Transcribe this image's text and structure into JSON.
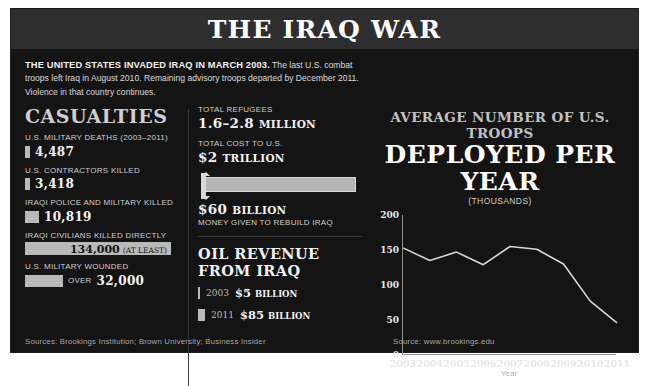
{
  "header": {
    "title": "THE IRAQ WAR"
  },
  "intro": {
    "lead": "THE UNITED STATES INVADED IRAQ IN MARCH 2003.",
    "body": " The last U.S. combat troops left Iraq in August 2010. Remaining advisory troops departed by December 2011. Violence in that country continues."
  },
  "casualties": {
    "heading": "CASUALTIES",
    "items": [
      {
        "label": "U.S. MILITARY DEATHS (2003–2011)",
        "value": "4,487",
        "suffix": "",
        "bar_width": 5,
        "value_in_bar": false
      },
      {
        "label": "U.S. CONTRACTORS KILLED",
        "value": "3,418",
        "suffix": "",
        "bar_width": 5,
        "value_in_bar": false
      },
      {
        "label": "IRAQI POLICE AND MILITARY KILLED",
        "value": "10,819",
        "suffix": "",
        "bar_width": 14,
        "value_in_bar": false
      },
      {
        "label": "IRAQI CIVILIANS KILLED DIRECTLY",
        "value": "134,000",
        "suffix": "(AT LEAST)",
        "bar_width": 146,
        "value_in_bar": true
      },
      {
        "label": "U.S. MILITARY WOUNDED",
        "value": "32,000",
        "suffix": "OVER",
        "bar_width": 38,
        "value_in_bar": false
      }
    ]
  },
  "middle": {
    "refugees": {
      "label": "TOTAL REFUGEES",
      "value": "1.6–2.8",
      "unit": "MILLION"
    },
    "cost": {
      "label": "TOTAL COST TO U.S.",
      "value": "$2",
      "unit": "TRILLION"
    },
    "rebuild": {
      "value": "$60",
      "unit": "BILLION",
      "note": "MONEY GIVEN TO REBUILD IRAQ"
    },
    "oil": {
      "heading": "OIL REVENUE FROM IRAQ",
      "rows": [
        {
          "year": "2003",
          "value": "$5",
          "unit": "BILLION",
          "bar_width": 2
        },
        {
          "year": "2011",
          "value": "$85",
          "unit": "BILLION",
          "bar_width": 7
        }
      ]
    }
  },
  "chart_data": {
    "type": "line",
    "title_line1": "AVERAGE NUMBER OF U.S. TROOPS",
    "title_line2": "DEPLOYED PER YEAR",
    "subtitle": "(THOUSANDS)",
    "xlabel": "Year",
    "ylabel": "",
    "categories": [
      "2003",
      "2004",
      "2005",
      "2006",
      "2007",
      "2008",
      "2009",
      "2010",
      "2011"
    ],
    "x": [
      2003,
      2004,
      2005,
      2006,
      2007,
      2008,
      2009,
      2010,
      2011
    ],
    "values": [
      153,
      135,
      147,
      129,
      155,
      151,
      130,
      77,
      46
    ],
    "yticks": [
      0,
      50,
      100,
      150,
      200
    ],
    "ylim": [
      0,
      200
    ],
    "grid": false,
    "legend": false,
    "line_color": "#d8d8d8"
  },
  "sources": {
    "left": "Sources: Brookings Institution; Brown University; Business Insider",
    "right": "Source: www.brookings.edu"
  },
  "caption": ""
}
